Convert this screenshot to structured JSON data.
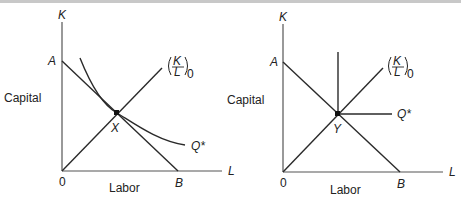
{
  "figure": {
    "panels": [
      {
        "id": "left",
        "axis_y_label": "K",
        "axis_x_label": "L",
        "y_title": "Capital",
        "x_title": "Labor",
        "origin_label": "0",
        "intercept_y_label": "A",
        "intercept_x_label": "B",
        "ray_label_num": "K",
        "ray_label_den": "L",
        "ray_label_sub": "0",
        "point_label": "X",
        "isoquant_label": "Q*",
        "isoquant_type": "smooth convex (substitutable inputs)"
      },
      {
        "id": "right",
        "axis_y_label": "K",
        "axis_x_label": "L",
        "y_title": "Capital",
        "x_title": "Labor",
        "origin_label": "0",
        "intercept_y_label": "A",
        "intercept_x_label": "B",
        "ray_label_num": "K",
        "ray_label_den": "L",
        "ray_label_sub": "0",
        "point_label": "Y",
        "isoquant_label": "Q*",
        "isoquant_type": "L-shaped (fixed proportions)"
      }
    ],
    "colors": {
      "line": "#2a2a2a",
      "axis": "#555555",
      "text": "#222222",
      "background": "#ffffff"
    }
  }
}
